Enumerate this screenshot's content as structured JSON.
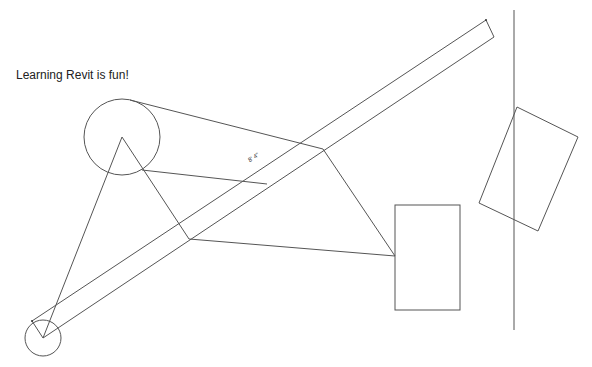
{
  "canvas": {
    "background": "#ffffff",
    "line_color": "#555555"
  },
  "text_note": {
    "label": "Learning Revit is fun!"
  },
  "dimension": {
    "label": "8' 4\""
  },
  "elements": [
    {
      "type": "circle",
      "name": "large-circle"
    },
    {
      "type": "circle",
      "name": "small-circle"
    },
    {
      "type": "polygon",
      "name": "angled-beam"
    },
    {
      "type": "polyline",
      "name": "triangle-lines"
    },
    {
      "type": "polyline",
      "name": "quadrilateral-lines"
    },
    {
      "type": "rect",
      "name": "upright-rectangle"
    },
    {
      "type": "line",
      "name": "vertical-reference-line"
    },
    {
      "type": "polygon",
      "name": "rotated-rectangle"
    }
  ]
}
